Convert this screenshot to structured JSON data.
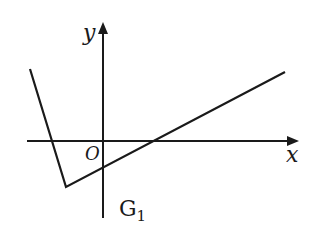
{
  "diagram": {
    "axes": {
      "x_label": "x",
      "y_label": "y",
      "origin_label": "O"
    },
    "graph_label": {
      "main": "G",
      "subscript": "1"
    },
    "polyline_points": "30,69 66,187 285,72",
    "colors": {
      "stroke": "#1a1a1a",
      "background": "#ffffff"
    }
  }
}
